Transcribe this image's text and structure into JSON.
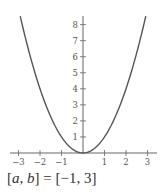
{
  "chart_data": {
    "type": "line",
    "title": "",
    "xlabel": "",
    "ylabel": "",
    "function": "y = x^2",
    "series": [
      {
        "name": "y = x^2",
        "x": [
          -2.92,
          -2.5,
          -2,
          -1.5,
          -1,
          -0.5,
          0,
          0.5,
          1,
          1.5,
          2,
          2.5,
          2.92
        ],
        "values": [
          8.53,
          6.25,
          4,
          2.25,
          1,
          0.25,
          0,
          0.25,
          1,
          2.25,
          4,
          6.25,
          8.53
        ]
      }
    ],
    "xlim": [
      -3.4,
      3.4
    ],
    "ylim": [
      0,
      8.5
    ],
    "x_ticks": [
      -3,
      -2,
      -1,
      1,
      2,
      3
    ],
    "x_tick_labels": [
      "−3",
      "−2",
      "−1",
      "1",
      "2",
      "3"
    ],
    "y_ticks": [
      1,
      2,
      3,
      4,
      5,
      6,
      7,
      8
    ],
    "y_tick_labels": [
      "1",
      "2",
      "3",
      "4",
      "5",
      "6",
      "7",
      "8"
    ],
    "grid": false,
    "legend": null,
    "annotations": []
  },
  "caption": {
    "open_bracket": "[",
    "var_a": "a",
    "comma": ", ",
    "var_b": "b",
    "rest": "] = [−1, 3]"
  },
  "colors": {
    "curve": "#555555",
    "axes": "#666666",
    "text": "#444444"
  }
}
